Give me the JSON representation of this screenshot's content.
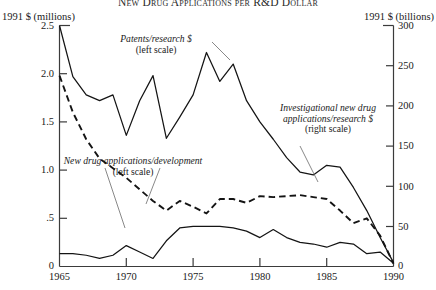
{
  "chart": {
    "title": "New Drug Applications per R&D Dollar",
    "axis_left_caption": "1991 $ (millions)",
    "axis_right_caption": "1991 $ (billions)"
  },
  "annotations": {
    "patents": {
      "line1": "Patents/research $",
      "line2": "(left scale)"
    },
    "nda": {
      "line1": "New drug applications/development",
      "line2": "(left scale)"
    },
    "inda": {
      "line1": "Investigational new drug",
      "line2": "applications/research $",
      "line3": "(right scale)"
    }
  },
  "ticks": {
    "left": [
      "2.5",
      "2.0",
      "1.5",
      "1.0",
      ".5",
      "0"
    ],
    "right": [
      "300",
      "250",
      "200",
      "150",
      "100",
      "50",
      "0"
    ],
    "x": [
      "1965",
      "1970",
      "1975",
      "1980",
      "1985",
      "1990"
    ]
  },
  "colors": {
    "ink": "#1a1a1a",
    "frame": "#3b3b3b",
    "background": "#ffffff"
  },
  "chart_data": {
    "type": "line",
    "title": "New Drug Applications per R&D Dollar",
    "xlabel": "",
    "ylabel": "1991 $ (millions)",
    "y2label": "1991 $ (billions)",
    "xlim": [
      1965,
      1990
    ],
    "ylim": [
      0,
      2.5
    ],
    "y2lim": [
      0,
      300
    ],
    "grid": false,
    "legend": "inline-annotations",
    "xticks": [
      1965,
      1970,
      1975,
      1980,
      1985,
      1990
    ],
    "yticks": [
      0,
      0.5,
      1.0,
      1.5,
      2.0,
      2.5
    ],
    "y2ticks": [
      0,
      50,
      100,
      150,
      200,
      250,
      300
    ],
    "x": [
      1965,
      1966,
      1967,
      1968,
      1969,
      1970,
      1971,
      1972,
      1973,
      1974,
      1975,
      1976,
      1977,
      1978,
      1979,
      1980,
      1981,
      1982,
      1983,
      1984,
      1985,
      1986,
      1987,
      1988,
      1989,
      1990
    ],
    "series": [
      {
        "name": "Patents/research $",
        "axis": "left",
        "style": "solid",
        "values": [
          2.5,
          1.97,
          1.78,
          1.72,
          1.78,
          1.36,
          1.72,
          1.98,
          1.33,
          1.55,
          1.78,
          2.22,
          1.92,
          2.1,
          1.72,
          1.5,
          1.32,
          1.13,
          0.98,
          0.95,
          1.05,
          1.03,
          0.82,
          0.58,
          0.3,
          0.04
        ]
      },
      {
        "name": "New drug applications/development",
        "axis": "left",
        "style": "dashed",
        "values": [
          1.98,
          1.6,
          1.32,
          1.12,
          1.02,
          0.92,
          0.8,
          0.68,
          0.58,
          0.68,
          0.62,
          0.55,
          0.7,
          0.7,
          0.66,
          0.73,
          0.72,
          0.73,
          0.74,
          0.72,
          0.7,
          0.58,
          0.45,
          0.5,
          0.32,
          0.03
        ]
      },
      {
        "name": "Investigational new drug applications/research $",
        "axis": "right",
        "style": "solid",
        "values": [
          16,
          16,
          14,
          10,
          14,
          26,
          18,
          10,
          32,
          48,
          50,
          50,
          50,
          48,
          44,
          36,
          46,
          36,
          30,
          28,
          24,
          30,
          28,
          16,
          18,
          4
        ]
      }
    ]
  }
}
